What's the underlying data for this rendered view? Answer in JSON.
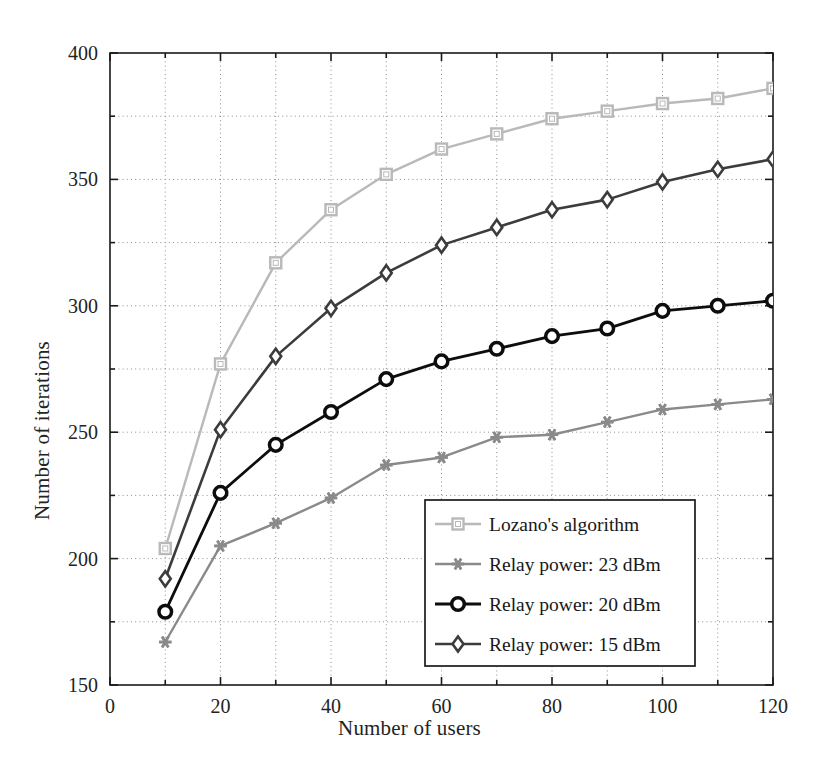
{
  "chart_data": {
    "type": "line",
    "title": "",
    "xlabel": "Number of users",
    "ylabel": "Number of iterations",
    "xlim": [
      0,
      120
    ],
    "ylim": [
      150,
      400
    ],
    "xticks": [
      0,
      20,
      40,
      60,
      80,
      100,
      120
    ],
    "yticks": [
      150,
      200,
      250,
      300,
      350,
      400
    ],
    "x_minor_gridlines": [
      10,
      30,
      50,
      70,
      90,
      110
    ],
    "y_minor_gridlines": [
      175,
      225,
      275,
      325,
      375
    ],
    "grid": true,
    "grid_style": "dotted",
    "legend_position": "lower right",
    "x": [
      10,
      20,
      30,
      40,
      50,
      60,
      70,
      80,
      90,
      100,
      110,
      120
    ],
    "series": [
      {
        "name": "Lozano's algorithm",
        "marker": "square",
        "color": "#b9b9b9",
        "values": [
          204,
          277,
          317,
          338,
          352,
          362,
          368,
          374,
          377,
          380,
          382,
          386
        ]
      },
      {
        "name": "Relay power: 23 dBm",
        "marker": "star",
        "color": "#8a8a8a",
        "values": [
          167,
          205,
          214,
          224,
          237,
          240,
          248,
          249,
          254,
          259,
          261,
          263
        ]
      },
      {
        "name": "Relay power: 20 dBm",
        "marker": "circle",
        "color": "#0d0d0d",
        "values": [
          179,
          226,
          245,
          258,
          271,
          278,
          283,
          288,
          291,
          298,
          300,
          302
        ]
      },
      {
        "name": "Relay power: 15 dBm",
        "marker": "diamond",
        "color": "#3c3c3c",
        "values": [
          192,
          251,
          280,
          299,
          313,
          324,
          331,
          338,
          342,
          349,
          354,
          358
        ]
      }
    ]
  },
  "axes": {
    "ytick_labels": [
      "400",
      "350",
      "300",
      "250",
      "200",
      "150"
    ],
    "xtick_labels": [
      "0",
      "20",
      "40",
      "60",
      "80",
      "100",
      "120"
    ],
    "xlabel_text": "Number of users",
    "ylabel_text": "Number of iterations"
  },
  "legend": {
    "items": [
      "Lozano's algorithm",
      "Relay power: 23 dBm",
      "Relay power: 20 dBm",
      "Relay power: 15 dBm"
    ]
  },
  "style": {
    "axis_color": "#1a1a1a",
    "grid_color": "#8e8e8e",
    "background": "#ffffff"
  }
}
